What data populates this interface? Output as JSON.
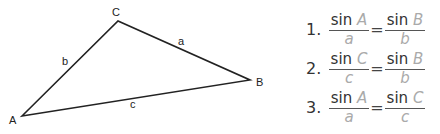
{
  "diagram": {
    "vertices": [
      {
        "name": "A",
        "x": 22,
        "y": 116
      },
      {
        "name": "B",
        "x": 250,
        "y": 80
      },
      {
        "name": "C",
        "x": 118,
        "y": 21
      }
    ],
    "vertex_labels": {
      "A": "A",
      "B": "B",
      "C": "C"
    },
    "side_labels": {
      "a": "a",
      "b": "b",
      "c": "c"
    },
    "line_color": "#222222"
  },
  "formulas": [
    {
      "number": "1.",
      "left": {
        "fn": "sin",
        "var": "A",
        "den": "a"
      },
      "eq": "=",
      "right": {
        "fn": "sin",
        "var": "B",
        "den": "b"
      }
    },
    {
      "number": "2.",
      "left": {
        "fn": "sin",
        "var": "C",
        "den": "c"
      },
      "eq": "=",
      "right": {
        "fn": "sin",
        "var": "B",
        "den": "b"
      }
    },
    {
      "number": "3.",
      "left": {
        "fn": "sin",
        "var": "A",
        "den": "a"
      },
      "eq": "=",
      "right": {
        "fn": "sin",
        "var": "C",
        "den": "c"
      }
    }
  ]
}
